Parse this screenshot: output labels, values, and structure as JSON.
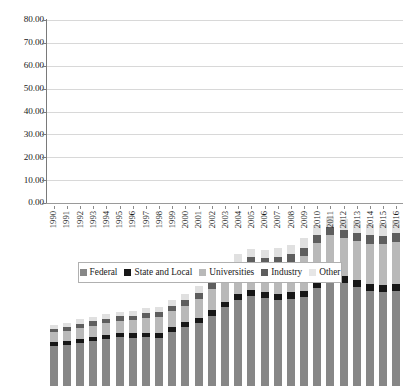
{
  "chart_data": {
    "type": "bar",
    "stacked": true,
    "title": "",
    "subtitle": "",
    "xlabel": "",
    "ylabel": "",
    "ylim": [
      0,
      80
    ],
    "ytick_step": 10,
    "ytick_labels": [
      "0.00",
      "10.00",
      "20.00",
      "30.00",
      "40.00",
      "50.00",
      "60.00",
      "70.00",
      "80.00"
    ],
    "grid": true,
    "legend_position": "bottom",
    "categories": [
      "1990",
      "1991",
      "1992",
      "1993",
      "1994",
      "1995",
      "1996",
      "1997",
      "1998",
      "1999",
      "2000",
      "2001",
      "2002",
      "2003",
      "2004",
      "2005",
      "2006",
      "2007",
      "2008",
      "2009",
      "2010",
      "2011",
      "2012",
      "2013",
      "2014",
      "2015",
      "2016"
    ],
    "series": [
      {
        "name": "Federal",
        "color": "#878787",
        "values": [
          17.6,
          17.9,
          18.8,
          19.6,
          20.7,
          21.3,
          21.2,
          21.4,
          21.0,
          23.7,
          25.9,
          27.6,
          30.7,
          34.4,
          37.7,
          39.2,
          38.5,
          37.7,
          38.2,
          38.8,
          43.0,
          46.2,
          45.2,
          43.4,
          41.4,
          41.3,
          41.4
        ]
      },
      {
        "name": "State and Local",
        "color": "#171717",
        "values": [
          1.6,
          1.6,
          1.7,
          1.7,
          1.7,
          1.8,
          1.9,
          1.9,
          2.0,
          2.0,
          2.1,
          2.2,
          2.4,
          2.5,
          2.6,
          2.7,
          2.7,
          2.7,
          2.8,
          2.9,
          3.0,
          3.0,
          3.1,
          3.1,
          3.0,
          3.0,
          3.0
        ]
      },
      {
        "name": "Universities",
        "color": "#b9b9b9",
        "values": [
          4.2,
          4.6,
          5.0,
          5.1,
          5.2,
          5.3,
          5.6,
          6.4,
          7.2,
          7.0,
          7.1,
          8.4,
          9.2,
          10.0,
          10.6,
          11.1,
          11.4,
          12.7,
          13.1,
          15.3,
          16.3,
          16.6,
          16.5,
          17.0,
          17.8,
          17.8,
          18.7
        ]
      },
      {
        "name": "Industry",
        "color": "#5e5e5e",
        "values": [
          1.7,
          1.8,
          1.8,
          1.8,
          1.9,
          2.0,
          2.1,
          2.2,
          2.3,
          2.4,
          2.5,
          2.6,
          2.7,
          3.0,
          3.1,
          3.2,
          3.2,
          3.3,
          3.4,
          3.5,
          3.6,
          3.6,
          3.6,
          3.6,
          3.6,
          3.6,
          3.7
        ]
      },
      {
        "name": "Other",
        "color": "#e0e0e0",
        "values": [
          1.7,
          1.7,
          1.8,
          1.9,
          1.9,
          2.0,
          2.1,
          2.2,
          2.2,
          2.3,
          2.5,
          2.8,
          3.0,
          3.3,
          3.5,
          3.7,
          3.8,
          3.9,
          4.0,
          4.2,
          4.4,
          4.5,
          4.7,
          5.0,
          5.2,
          5.4,
          5.6
        ]
      }
    ],
    "totals": [
      26.8,
      27.6,
      29.1,
      30.1,
      31.4,
      32.4,
      32.9,
      34.1,
      34.7,
      37.4,
      40.1,
      43.6,
      48.0,
      53.2,
      57.5,
      59.9,
      59.6,
      60.3,
      61.5,
      64.7,
      70.3,
      73.9,
      73.1,
      72.1,
      71.0,
      71.1,
      72.4
    ]
  },
  "legend": {
    "items": [
      {
        "label": "Federal",
        "key": "federal"
      },
      {
        "label": "State and Local",
        "key": "state"
      },
      {
        "label": "Universities",
        "key": "universities"
      },
      {
        "label": "Industry",
        "key": "industry"
      },
      {
        "label": "Other",
        "key": "other"
      }
    ]
  }
}
